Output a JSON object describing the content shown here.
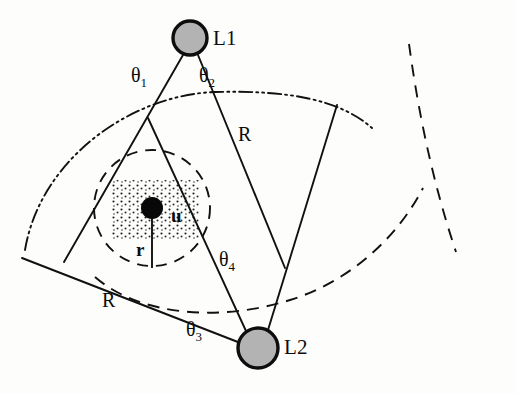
{
  "figure": {
    "kind": "geometry-diagram",
    "background_color": "#fdfdfc",
    "ink_color": "#0d0d0d",
    "node_fill_color": "#b3b3b3"
  },
  "nodes": [
    {
      "id": "L1",
      "label": "L1",
      "cx": 190,
      "cy": 38,
      "radius": 17,
      "label_x": 213,
      "label_y": 26
    },
    {
      "id": "L2",
      "label": "L2",
      "cx": 258,
      "cy": 348,
      "radius": 20,
      "label_x": 284,
      "label_y": 335
    }
  ],
  "unknown_node": {
    "label": "u",
    "cx": 152,
    "cy": 208,
    "dot_radius": 11,
    "label_x": 171,
    "label_y": 205
  },
  "radius_marker": {
    "label": "r",
    "from_x": 152,
    "from_y": 208,
    "to_x": 152,
    "to_y": 268,
    "label_x": 136,
    "label_y": 239
  },
  "distance_labels": [
    {
      "label": "R",
      "x": 238,
      "y": 123
    },
    {
      "label": "R",
      "x": 102,
      "y": 289
    }
  ],
  "angle_labels": [
    {
      "name": "theta1",
      "base": "θ",
      "sub": "1",
      "x": 131,
      "y": 64
    },
    {
      "name": "theta2",
      "base": "θ",
      "sub": "2",
      "x": 199,
      "y": 64
    },
    {
      "name": "theta3",
      "base": "θ",
      "sub": "3",
      "x": 186,
      "y": 318
    },
    {
      "name": "theta4",
      "base": "θ",
      "sub": "4",
      "x": 219,
      "y": 248
    }
  ],
  "uncertainty_rect": {
    "x": 112,
    "y": 180,
    "width": 88,
    "height": 60,
    "fill_pattern": "stipple-dots"
  },
  "inner_circle": {
    "cx": 152,
    "cy": 208,
    "r": 58,
    "style": "dashed"
  },
  "arcs": [
    {
      "name": "outer-sector-arc",
      "style": "dash-dot-dot",
      "path": "M 25,250 C 40,160 130,95 215,92 C 290,90 340,100 372,128"
    },
    {
      "name": "l2-sector-arc",
      "style": "dashed",
      "path": "M 95,277 C 140,316 220,322 290,300 C 345,283 395,242 423,188"
    },
    {
      "name": "right-outer-arc",
      "style": "dashed",
      "path": "M 409,44 C 418,110 432,180 456,252"
    }
  ],
  "sector_lines": [
    {
      "name": "l1-left-ray",
      "x1": 183,
      "y1": 55,
      "x2": 64,
      "y2": 262
    },
    {
      "name": "l1-right-ray",
      "x1": 198,
      "y1": 55,
      "x2": 285,
      "y2": 268
    },
    {
      "name": "l2-left-ray",
      "x1": 246,
      "y1": 331,
      "x2": 148,
      "y2": 118
    },
    {
      "name": "l2-right-ray",
      "x1": 268,
      "y1": 330,
      "x2": 337,
      "y2": 105
    },
    {
      "name": "l2-lower-left-chord",
      "x1": 243,
      "y1": 344,
      "x2": 22,
      "y2": 258
    }
  ]
}
